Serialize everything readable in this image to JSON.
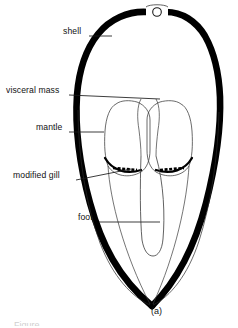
{
  "figure": {
    "caption": "(a)",
    "partial_caption_fragment": "Figure",
    "background_color": "#ffffff",
    "ink_color": "#000000",
    "outline_color": "#1a1a1a"
  },
  "labels": [
    {
      "id": "shell",
      "text": "shell",
      "text_x": 63,
      "text_y": 32,
      "leader": {
        "x1": 89,
        "y1": 36,
        "x2": 112,
        "y2": 36
      }
    },
    {
      "id": "visceral-mass",
      "text": "visceral mass",
      "text_x": 6,
      "text_y": 91,
      "leader": {
        "x1": 69,
        "y1": 95,
        "x2": 160,
        "y2": 99
      }
    },
    {
      "id": "mantle",
      "text": "mantle",
      "text_x": 36,
      "text_y": 128,
      "leader": {
        "x1": 69,
        "y1": 132,
        "x2": 104,
        "y2": 132
      }
    },
    {
      "id": "modified-gill",
      "text": "modified gill",
      "text_x": 13,
      "text_y": 176,
      "leader": {
        "x1": 76,
        "y1": 180,
        "x2": 131,
        "y2": 169
      }
    },
    {
      "id": "foot",
      "text": "foot",
      "text_x": 78,
      "text_y": 218,
      "leader": {
        "x1": 99,
        "y1": 222,
        "x2": 160,
        "y2": 222
      }
    }
  ],
  "anatomy_parts": [
    {
      "name": "shell",
      "description": "thick black bivalve shell outline, pointed at base"
    },
    {
      "name": "umbo-notch",
      "description": "small white circle at apex of shell"
    },
    {
      "name": "visceral-mass",
      "description": "central mass between mantle lobes"
    },
    {
      "name": "mantle",
      "description": "paired inner lobes following shell contour"
    },
    {
      "name": "modified-gill",
      "description": "dark hatched arcs across lower mantle lobes"
    },
    {
      "name": "foot",
      "description": "elongated rounded central structure extending downward"
    }
  ]
}
